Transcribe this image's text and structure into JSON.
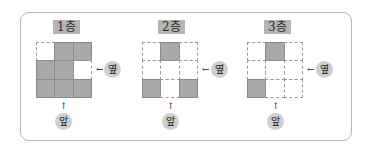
{
  "floors": [
    {
      "label": "1층",
      "cells": [
        [
          0,
          1,
          1
        ],
        [
          1,
          1,
          0
        ],
        [
          1,
          1,
          1
        ]
      ]
    },
    {
      "label": "2층",
      "cells": [
        [
          0,
          1,
          0
        ],
        [
          0,
          0,
          0
        ],
        [
          1,
          0,
          1
        ]
      ]
    },
    {
      "label": "3층",
      "cells": [
        [
          0,
          1,
          0
        ],
        [
          0,
          0,
          0
        ],
        [
          1,
          0,
          0
        ]
      ]
    }
  ],
  "side_label": "옆",
  "front_label": "앞",
  "arrow_left": "←",
  "arrow_up": "↑",
  "colors": {
    "filled": "#a9a9a9",
    "label_bg": "#b5b5b5",
    "circle": "#cfcfcf"
  }
}
